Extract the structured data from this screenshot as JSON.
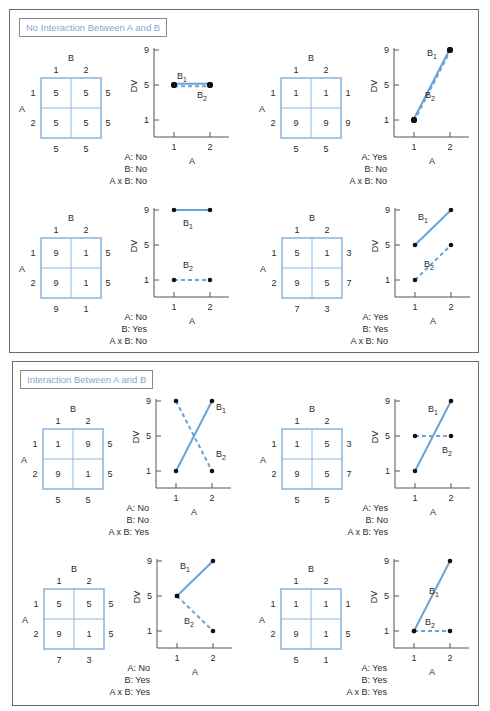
{
  "colors": {
    "line": "#6aa3d8",
    "grid": "#8fb8df",
    "frame": "#6b6b6b",
    "title_text": "#7fa9d6"
  },
  "panels": [
    {
      "title": "No Interaction Between A and B",
      "cells": [
        {
          "matrix": {
            "factor_a": "A",
            "factor_b": "B",
            "col_labels": [
              "1",
              "2"
            ],
            "row_labels": [
              "1",
              "2"
            ],
            "values": [
              [
                "5",
                "5"
              ],
              [
                "5",
                "5"
              ]
            ],
            "row_means": [
              "5",
              "5"
            ],
            "col_means": [
              "5",
              "5"
            ]
          },
          "chart": {
            "ylabel": "DV",
            "xlabel": "A",
            "yticks": [
              "9",
              "5",
              "1"
            ],
            "xticks": [
              "1",
              "2"
            ],
            "B1": [
              5,
              5
            ],
            "B2": [
              5,
              5
            ],
            "b1_label": "B",
            "b1_sub": "1",
            "b2_label": "B",
            "b2_sub": "2"
          },
          "caption": {
            "a": "A: No",
            "b": "B: No",
            "axb": "A x B: No"
          }
        },
        {
          "matrix": {
            "factor_a": "A",
            "factor_b": "B",
            "col_labels": [
              "1",
              "2"
            ],
            "row_labels": [
              "1",
              "2"
            ],
            "values": [
              [
                "1",
                "1"
              ],
              [
                "9",
                "9"
              ]
            ],
            "row_means": [
              "1",
              "9"
            ],
            "col_means": [
              "5",
              "5"
            ]
          },
          "chart": {
            "ylabel": "DV",
            "xlabel": "A",
            "yticks": [
              "9",
              "5",
              "1"
            ],
            "xticks": [
              "1",
              "2"
            ],
            "B1": [
              1,
              9
            ],
            "B2": [
              1,
              9
            ],
            "b1_label": "B",
            "b1_sub": "1",
            "b2_label": "B",
            "b2_sub": "2"
          },
          "caption": {
            "a": "A: Yes",
            "b": "B: No",
            "axb": "A x B: No"
          }
        },
        {
          "matrix": {
            "factor_a": "A",
            "factor_b": "B",
            "col_labels": [
              "1",
              "2"
            ],
            "row_labels": [
              "1",
              "2"
            ],
            "values": [
              [
                "9",
                "1"
              ],
              [
                "9",
                "1"
              ]
            ],
            "row_means": [
              "5",
              "5"
            ],
            "col_means": [
              "9",
              "1"
            ]
          },
          "chart": {
            "ylabel": "DV",
            "xlabel": "A",
            "yticks": [
              "9",
              "5",
              "1"
            ],
            "xticks": [
              "1",
              "2"
            ],
            "B1": [
              9,
              9
            ],
            "B2": [
              1,
              1
            ],
            "b1_label": "B",
            "b1_sub": "1",
            "b2_label": "B",
            "b2_sub": "2"
          },
          "caption": {
            "a": "A: No",
            "b": "B: Yes",
            "axb": "A x B: No"
          }
        },
        {
          "matrix": {
            "factor_a": "A",
            "factor_b": "B",
            "col_labels": [
              "1",
              "2"
            ],
            "row_labels": [
              "1",
              "2"
            ],
            "values": [
              [
                "5",
                "1"
              ],
              [
                "9",
                "5"
              ]
            ],
            "row_means": [
              "3",
              "7"
            ],
            "col_means": [
              "7",
              "3"
            ]
          },
          "chart": {
            "ylabel": "DV",
            "xlabel": "A",
            "yticks": [
              "9",
              "5",
              "1"
            ],
            "xticks": [
              "1",
              "2"
            ],
            "B1": [
              5,
              9
            ],
            "B2": [
              1,
              5
            ],
            "b1_label": "B",
            "b1_sub": "1",
            "b2_label": "B",
            "b2_sub": "2"
          },
          "caption": {
            "a": "A: Yes",
            "b": "B: Yes",
            "axb": "A x B: No"
          }
        }
      ]
    },
    {
      "title": "Interaction Between A and B",
      "cells": [
        {
          "matrix": {
            "factor_a": "A",
            "factor_b": "B",
            "col_labels": [
              "1",
              "2"
            ],
            "row_labels": [
              "1",
              "2"
            ],
            "values": [
              [
                "1",
                "9"
              ],
              [
                "9",
                "1"
              ]
            ],
            "row_means": [
              "5",
              "5"
            ],
            "col_means": [
              "5",
              "5"
            ]
          },
          "chart": {
            "ylabel": "DV",
            "xlabel": "A",
            "yticks": [
              "9",
              "5",
              "1"
            ],
            "xticks": [
              "1",
              "2"
            ],
            "B1": [
              1,
              9
            ],
            "B2": [
              9,
              1
            ],
            "b1_label": "B",
            "b1_sub": "1",
            "b2_label": "B",
            "b2_sub": "2"
          },
          "caption": {
            "a": "A: No",
            "b": "B: No",
            "axb": "A x B: Yes"
          }
        },
        {
          "matrix": {
            "factor_a": "A",
            "factor_b": "B",
            "col_labels": [
              "1",
              "2"
            ],
            "row_labels": [
              "1",
              "2"
            ],
            "values": [
              [
                "1",
                "5"
              ],
              [
                "9",
                "5"
              ]
            ],
            "row_means": [
              "3",
              "7"
            ],
            "col_means": [
              "5",
              "5"
            ]
          },
          "chart": {
            "ylabel": "DV",
            "xlabel": "A",
            "yticks": [
              "9",
              "5",
              "1"
            ],
            "xticks": [
              "1",
              "2"
            ],
            "B1": [
              1,
              9
            ],
            "B2": [
              5,
              5
            ],
            "b1_label": "B",
            "b1_sub": "1",
            "b2_label": "B",
            "b2_sub": "2"
          },
          "caption": {
            "a": "A: Yes",
            "b": "B: No",
            "axb": "A x B: Yes"
          }
        },
        {
          "matrix": {
            "factor_a": "A",
            "factor_b": "B",
            "col_labels": [
              "1",
              "2"
            ],
            "row_labels": [
              "1",
              "2"
            ],
            "values": [
              [
                "5",
                "5"
              ],
              [
                "9",
                "1"
              ]
            ],
            "row_means": [
              "5",
              "5"
            ],
            "col_means": [
              "7",
              "3"
            ]
          },
          "chart": {
            "ylabel": "DV",
            "xlabel": "A",
            "yticks": [
              "9",
              "5",
              "1"
            ],
            "xticks": [
              "1",
              "2"
            ],
            "B1": [
              5,
              9
            ],
            "B2": [
              5,
              1
            ],
            "b1_label": "B",
            "b1_sub": "1",
            "b2_label": "B",
            "b2_sub": "2"
          },
          "caption": {
            "a": "A: No",
            "b": "B: Yes",
            "axb": "A x B: Yes"
          }
        },
        {
          "matrix": {
            "factor_a": "A",
            "factor_b": "B",
            "col_labels": [
              "1",
              "2"
            ],
            "row_labels": [
              "1",
              "2"
            ],
            "values": [
              [
                "1",
                "1"
              ],
              [
                "9",
                "1"
              ]
            ],
            "row_means": [
              "1",
              "5"
            ],
            "col_means": [
              "5",
              "1"
            ]
          },
          "chart": {
            "ylabel": "DV",
            "xlabel": "A",
            "yticks": [
              "9",
              "5",
              "1"
            ],
            "xticks": [
              "1",
              "2"
            ],
            "B1": [
              1,
              9
            ],
            "B2": [
              1,
              1
            ],
            "b1_label": "B",
            "b1_sub": "1",
            "b2_label": "B",
            "b2_sub": "2"
          },
          "caption": {
            "a": "A: Yes",
            "b": "B: Yes",
            "axb": "A x B: Yes"
          }
        }
      ]
    }
  ]
}
